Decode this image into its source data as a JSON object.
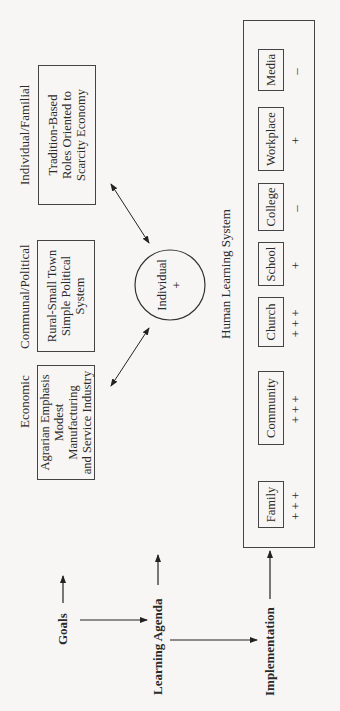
{
  "left_labels": {
    "goals": "Goals",
    "learning_agenda": "Learning Agenda",
    "implementation": "Implementation"
  },
  "goal_categories": [
    {
      "header": "Economic",
      "box_lines": [
        "Agrarian Emphasis",
        "Modest Manufacturing",
        "and Service Industry"
      ]
    },
    {
      "header": "Communal/Political",
      "box_lines": [
        "Rural-Small Town",
        "Simple Political System"
      ]
    },
    {
      "header": "Individual/Familial",
      "box_lines": [
        "Tradition-Based",
        "Roles Oriented to",
        "Scarcity Economy"
      ]
    }
  ],
  "individual": {
    "label": "Individual",
    "rating": "+"
  },
  "learning_system": {
    "title": "Human Learning System",
    "institutions": [
      {
        "name": "Family",
        "rating": "+++"
      },
      {
        "name": "Community",
        "rating": "+++"
      },
      {
        "name": "Church",
        "rating": "+++"
      },
      {
        "name": "School",
        "rating": "+"
      },
      {
        "name": "College",
        "rating": "–"
      },
      {
        "name": "Workplace",
        "rating": "+"
      },
      {
        "name": "Media",
        "rating": "–"
      }
    ]
  }
}
